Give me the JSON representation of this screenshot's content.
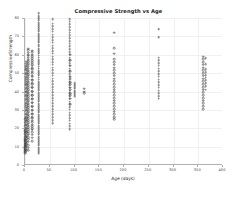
{
  "chart_data": {
    "type": "scatter",
    "title": "Compressive Strength vs Age",
    "xlabel": "Age (days)",
    "ylabel": "CompressiveStrength",
    "xlim": [
      0,
      400
    ],
    "ylim": [
      0,
      80
    ],
    "xticks": [
      0,
      50,
      100,
      150,
      200,
      250,
      300,
      350,
      400
    ],
    "yticks": [
      0,
      10,
      20,
      30,
      40,
      50,
      60,
      70,
      80
    ],
    "grid": true,
    "legend": null,
    "marker": "open-circle",
    "marker_color": "#464646",
    "points": [
      [
        1,
        9.0
      ],
      [
        1,
        10.4
      ],
      [
        1,
        11.6
      ],
      [
        1,
        12.2
      ],
      [
        1,
        6.3
      ],
      [
        1,
        8.5
      ],
      [
        1,
        7.5
      ],
      [
        1,
        13.3
      ],
      [
        1,
        15.0
      ],
      [
        1,
        16.5
      ],
      [
        1,
        11.0
      ],
      [
        1,
        9.6
      ],
      [
        1,
        14.0
      ],
      [
        1,
        17.2
      ],
      [
        1,
        8.0
      ],
      [
        1,
        12.8
      ],
      [
        1,
        6.9
      ],
      [
        1,
        10.1
      ],
      [
        1,
        13.8
      ],
      [
        1,
        19.0
      ],
      [
        1,
        21.0
      ],
      [
        1,
        23.0
      ],
      [
        1,
        25.0
      ],
      [
        1,
        18.3
      ],
      [
        3,
        12.0
      ],
      [
        3,
        14.5
      ],
      [
        3,
        16.0
      ],
      [
        3,
        18.0
      ],
      [
        3,
        20.0
      ],
      [
        3,
        22.0
      ],
      [
        3,
        24.0
      ],
      [
        3,
        26.0
      ],
      [
        3,
        28.0
      ],
      [
        3,
        30.0
      ],
      [
        3,
        32.0
      ],
      [
        3,
        34.0
      ],
      [
        3,
        36.0
      ],
      [
        3,
        38.0
      ],
      [
        3,
        40.0
      ],
      [
        3,
        42.0
      ],
      [
        3,
        44.0
      ],
      [
        3,
        46.0
      ],
      [
        3,
        48.0
      ],
      [
        3,
        50.0
      ],
      [
        3,
        52.0
      ],
      [
        3,
        54.0
      ],
      [
        3,
        15.3
      ],
      [
        3,
        17.7
      ],
      [
        3,
        19.8
      ],
      [
        3,
        21.9
      ],
      [
        3,
        23.7
      ],
      [
        3,
        25.6
      ],
      [
        3,
        27.4
      ],
      [
        3,
        29.3
      ],
      [
        3,
        31.1
      ],
      [
        3,
        33.0
      ],
      [
        3,
        35.2
      ],
      [
        3,
        37.4
      ],
      [
        3,
        39.6
      ],
      [
        3,
        41.3
      ],
      [
        3,
        43.5
      ],
      [
        3,
        45.1
      ],
      [
        3,
        47.2
      ],
      [
        3,
        49.4
      ],
      [
        3,
        51.6
      ],
      [
        3,
        53.3
      ],
      [
        3,
        55.1
      ],
      [
        3,
        13.1
      ],
      [
        3,
        11.4
      ],
      [
        3,
        9.9
      ],
      [
        3,
        8.2
      ],
      [
        3,
        56.2
      ],
      [
        7,
        14.0
      ],
      [
        7,
        16.5
      ],
      [
        7,
        18.5
      ],
      [
        7,
        20.5
      ],
      [
        7,
        22.5
      ],
      [
        7,
        24.5
      ],
      [
        7,
        26.5
      ],
      [
        7,
        28.5
      ],
      [
        7,
        30.5
      ],
      [
        7,
        32.5
      ],
      [
        7,
        34.5
      ],
      [
        7,
        36.5
      ],
      [
        7,
        38.5
      ],
      [
        7,
        40.5
      ],
      [
        7,
        42.5
      ],
      [
        7,
        44.5
      ],
      [
        7,
        46.5
      ],
      [
        7,
        48.5
      ],
      [
        7,
        50.5
      ],
      [
        7,
        52.5
      ],
      [
        7,
        54.5
      ],
      [
        7,
        56.5
      ],
      [
        7,
        58.5
      ],
      [
        7,
        60.0
      ],
      [
        7,
        15.2
      ],
      [
        7,
        17.3
      ],
      [
        7,
        19.4
      ],
      [
        7,
        21.4
      ],
      [
        7,
        23.4
      ],
      [
        7,
        25.4
      ],
      [
        7,
        27.4
      ],
      [
        7,
        29.4
      ],
      [
        7,
        31.4
      ],
      [
        7,
        33.4
      ],
      [
        7,
        35.4
      ],
      [
        7,
        37.4
      ],
      [
        7,
        39.4
      ],
      [
        7,
        41.4
      ],
      [
        7,
        43.4
      ],
      [
        7,
        45.4
      ],
      [
        7,
        47.4
      ],
      [
        7,
        49.4
      ],
      [
        7,
        51.4
      ],
      [
        7,
        53.4
      ],
      [
        7,
        55.4
      ],
      [
        7,
        57.4
      ],
      [
        7,
        59.4
      ],
      [
        7,
        61.2
      ],
      [
        7,
        12.6
      ],
      [
        7,
        10.8
      ],
      [
        7,
        9.5
      ],
      [
        7,
        8.1
      ],
      [
        7,
        62.5
      ],
      [
        7,
        63.4
      ],
      [
        14,
        18.0
      ],
      [
        14,
        20.0
      ],
      [
        14,
        22.0
      ],
      [
        14,
        24.0
      ],
      [
        14,
        26.0
      ],
      [
        14,
        28.0
      ],
      [
        14,
        30.0
      ],
      [
        14,
        32.0
      ],
      [
        14,
        34.0
      ],
      [
        14,
        36.0
      ],
      [
        14,
        38.0
      ],
      [
        14,
        40.0
      ],
      [
        14,
        42.0
      ],
      [
        14,
        44.0
      ],
      [
        14,
        46.0
      ],
      [
        14,
        48.0
      ],
      [
        14,
        50.0
      ],
      [
        14,
        52.0
      ],
      [
        14,
        54.0
      ],
      [
        14,
        56.0
      ],
      [
        14,
        58.0
      ],
      [
        14,
        60.0
      ],
      [
        14,
        19.1
      ],
      [
        14,
        21.2
      ],
      [
        14,
        23.3
      ],
      [
        14,
        25.4
      ],
      [
        14,
        27.5
      ],
      [
        14,
        29.6
      ],
      [
        14,
        31.7
      ],
      [
        14,
        33.8
      ],
      [
        14,
        35.9
      ],
      [
        14,
        38.1
      ],
      [
        14,
        40.2
      ],
      [
        14,
        42.3
      ],
      [
        14,
        44.4
      ],
      [
        14,
        46.5
      ],
      [
        14,
        48.6
      ],
      [
        14,
        50.7
      ],
      [
        14,
        52.8
      ],
      [
        14,
        54.9
      ],
      [
        14,
        57.0
      ],
      [
        14,
        59.1
      ],
      [
        14,
        16.4
      ],
      [
        14,
        14.8
      ],
      [
        14,
        13.0
      ],
      [
        14,
        61.5
      ],
      [
        14,
        62.3
      ],
      [
        28,
        8.5
      ],
      [
        28,
        10.5
      ],
      [
        28,
        12.5
      ],
      [
        28,
        14.5
      ],
      [
        28,
        16.5
      ],
      [
        28,
        18.5
      ],
      [
        28,
        20.5
      ],
      [
        28,
        22.5
      ],
      [
        28,
        24.5
      ],
      [
        28,
        26.5
      ],
      [
        28,
        28.5
      ],
      [
        28,
        30.5
      ],
      [
        28,
        32.5
      ],
      [
        28,
        34.5
      ],
      [
        28,
        36.5
      ],
      [
        28,
        38.5
      ],
      [
        28,
        40.5
      ],
      [
        28,
        42.5
      ],
      [
        28,
        44.5
      ],
      [
        28,
        46.5
      ],
      [
        28,
        48.5
      ],
      [
        28,
        50.5
      ],
      [
        28,
        52.5
      ],
      [
        28,
        54.5
      ],
      [
        28,
        56.5
      ],
      [
        28,
        58.5
      ],
      [
        28,
        60.5
      ],
      [
        28,
        62.5
      ],
      [
        28,
        64.5
      ],
      [
        28,
        66.5
      ],
      [
        28,
        68.5
      ],
      [
        28,
        70.5
      ],
      [
        28,
        72.5
      ],
      [
        28,
        74.5
      ],
      [
        28,
        76.5
      ],
      [
        28,
        79.9
      ],
      [
        28,
        9.4
      ],
      [
        28,
        11.4
      ],
      [
        28,
        13.4
      ],
      [
        28,
        15.4
      ],
      [
        28,
        17.4
      ],
      [
        28,
        19.4
      ],
      [
        28,
        21.4
      ],
      [
        28,
        23.4
      ],
      [
        28,
        25.4
      ],
      [
        28,
        27.4
      ],
      [
        28,
        29.4
      ],
      [
        28,
        31.4
      ],
      [
        28,
        33.4
      ],
      [
        28,
        35.4
      ],
      [
        28,
        37.4
      ],
      [
        28,
        39.4
      ],
      [
        28,
        41.4
      ],
      [
        28,
        43.4
      ],
      [
        28,
        45.4
      ],
      [
        28,
        47.4
      ],
      [
        28,
        49.4
      ],
      [
        28,
        51.4
      ],
      [
        28,
        53.4
      ],
      [
        28,
        55.4
      ],
      [
        28,
        57.4
      ],
      [
        28,
        59.4
      ],
      [
        28,
        61.4
      ],
      [
        28,
        63.4
      ],
      [
        28,
        65.4
      ],
      [
        28,
        67.4
      ],
      [
        28,
        69.4
      ],
      [
        28,
        71.4
      ],
      [
        28,
        73.4
      ],
      [
        28,
        75.4
      ],
      [
        28,
        77.4
      ],
      [
        28,
        7.5
      ],
      [
        28,
        6.5
      ],
      [
        28,
        78.8
      ],
      [
        28,
        81.0
      ],
      [
        28,
        82.6
      ],
      [
        56,
        26.0
      ],
      [
        56,
        29.0
      ],
      [
        56,
        32.0
      ],
      [
        56,
        35.0
      ],
      [
        56,
        38.0
      ],
      [
        56,
        41.0
      ],
      [
        56,
        44.0
      ],
      [
        56,
        47.0
      ],
      [
        56,
        50.0
      ],
      [
        56,
        53.0
      ],
      [
        56,
        56.0
      ],
      [
        56,
        59.0
      ],
      [
        56,
        62.0
      ],
      [
        56,
        65.0
      ],
      [
        56,
        68.0
      ],
      [
        56,
        71.0
      ],
      [
        56,
        74.0
      ],
      [
        56,
        77.0
      ],
      [
        56,
        79.4
      ],
      [
        56,
        27.5
      ],
      [
        56,
        30.5
      ],
      [
        56,
        33.5
      ],
      [
        56,
        36.5
      ],
      [
        56,
        39.5
      ],
      [
        56,
        42.5
      ],
      [
        56,
        45.5
      ],
      [
        56,
        48.5
      ],
      [
        56,
        51.5
      ],
      [
        56,
        54.5
      ],
      [
        56,
        57.5
      ],
      [
        56,
        60.5
      ],
      [
        56,
        63.5
      ],
      [
        56,
        66.5
      ],
      [
        56,
        69.5
      ],
      [
        56,
        72.5
      ],
      [
        56,
        75.5
      ],
      [
        56,
        24.5
      ],
      [
        56,
        22.9
      ],
      [
        90,
        22.5
      ],
      [
        90,
        25.5
      ],
      [
        90,
        28.5
      ],
      [
        90,
        31.5
      ],
      [
        90,
        34.5
      ],
      [
        90,
        37.5
      ],
      [
        90,
        40.5
      ],
      [
        90,
        43.5
      ],
      [
        90,
        46.5
      ],
      [
        90,
        49.5
      ],
      [
        90,
        52.5
      ],
      [
        90,
        55.5
      ],
      [
        90,
        58.5
      ],
      [
        90,
        61.5
      ],
      [
        90,
        64.5
      ],
      [
        90,
        67.5
      ],
      [
        90,
        70.5
      ],
      [
        90,
        73.5
      ],
      [
        90,
        76.5
      ],
      [
        90,
        79.3
      ],
      [
        90,
        24.0
      ],
      [
        90,
        27.0
      ],
      [
        90,
        30.0
      ],
      [
        90,
        33.0
      ],
      [
        90,
        36.0
      ],
      [
        90,
        39.0
      ],
      [
        90,
        42.0
      ],
      [
        90,
        45.0
      ],
      [
        90,
        48.0
      ],
      [
        90,
        51.0
      ],
      [
        90,
        54.0
      ],
      [
        90,
        57.0
      ],
      [
        90,
        60.0
      ],
      [
        90,
        63.0
      ],
      [
        90,
        66.0
      ],
      [
        90,
        69.0
      ],
      [
        90,
        72.0
      ],
      [
        90,
        75.0
      ],
      [
        90,
        78.0
      ],
      [
        90,
        21.0
      ],
      [
        90,
        19.5
      ],
      [
        91,
        33.0
      ],
      [
        91,
        36.0
      ],
      [
        91,
        39.0
      ],
      [
        91,
        42.0
      ],
      [
        91,
        45.0
      ],
      [
        91,
        48.0
      ],
      [
        91,
        51.0
      ],
      [
        91,
        54.0
      ],
      [
        91,
        57.0
      ],
      [
        91,
        60.0
      ],
      [
        91,
        38.0
      ],
      [
        91,
        41.0
      ],
      [
        91,
        44.0
      ],
      [
        91,
        47.0
      ],
      [
        100,
        38.5
      ],
      [
        100,
        40.5
      ],
      [
        100,
        42.5
      ],
      [
        100,
        44.5
      ],
      [
        100,
        39.5
      ],
      [
        100,
        41.5
      ],
      [
        100,
        43.5
      ],
      [
        100,
        37.5
      ],
      [
        120,
        40.0
      ],
      [
        120,
        41.5
      ],
      [
        120,
        39.0
      ],
      [
        180,
        27.5
      ],
      [
        180,
        30.5
      ],
      [
        180,
        33.5
      ],
      [
        180,
        36.5
      ],
      [
        180,
        39.5
      ],
      [
        180,
        42.5
      ],
      [
        180,
        45.5
      ],
      [
        180,
        48.5
      ],
      [
        180,
        51.5
      ],
      [
        180,
        54.5
      ],
      [
        180,
        57.5
      ],
      [
        180,
        60.5
      ],
      [
        180,
        63.5
      ],
      [
        180,
        72.0
      ],
      [
        180,
        29.0
      ],
      [
        180,
        32.0
      ],
      [
        180,
        35.0
      ],
      [
        180,
        38.0
      ],
      [
        180,
        41.0
      ],
      [
        180,
        44.0
      ],
      [
        180,
        47.0
      ],
      [
        180,
        50.0
      ],
      [
        180,
        53.0
      ],
      [
        180,
        56.0
      ],
      [
        180,
        26.0
      ],
      [
        180,
        24.8
      ],
      [
        270,
        37.5
      ],
      [
        270,
        40.5
      ],
      [
        270,
        43.5
      ],
      [
        270,
        46.5
      ],
      [
        270,
        49.5
      ],
      [
        270,
        52.5
      ],
      [
        270,
        55.5
      ],
      [
        270,
        58.5
      ],
      [
        270,
        69.5
      ],
      [
        270,
        74.0
      ],
      [
        270,
        39.0
      ],
      [
        270,
        42.0
      ],
      [
        270,
        45.0
      ],
      [
        270,
        48.0
      ],
      [
        270,
        51.0
      ],
      [
        270,
        54.0
      ],
      [
        270,
        57.0
      ],
      [
        270,
        36.0
      ],
      [
        360,
        32.0
      ],
      [
        360,
        35.0
      ],
      [
        360,
        38.0
      ],
      [
        360,
        41.0
      ],
      [
        360,
        44.0
      ],
      [
        360,
        47.0
      ],
      [
        360,
        50.0
      ],
      [
        360,
        53.0
      ],
      [
        360,
        56.0
      ],
      [
        360,
        59.0
      ],
      [
        360,
        33.5
      ],
      [
        360,
        36.5
      ],
      [
        360,
        39.5
      ],
      [
        360,
        42.5
      ],
      [
        360,
        45.5
      ],
      [
        360,
        48.5
      ],
      [
        360,
        51.5
      ],
      [
        360,
        54.5
      ],
      [
        360,
        57.5
      ],
      [
        360,
        30.5
      ],
      [
        365,
        43.0
      ],
      [
        365,
        46.0
      ],
      [
        365,
        49.0
      ],
      [
        365,
        52.0
      ],
      [
        365,
        55.0
      ],
      [
        365,
        58.0
      ],
      [
        365,
        44.5
      ],
      [
        365,
        47.5
      ],
      [
        365,
        50.5
      ],
      [
        365,
        41.0
      ]
    ]
  }
}
